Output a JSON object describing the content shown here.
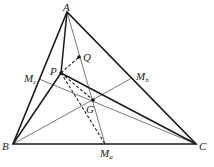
{
  "diagram": {
    "points": {
      "A": {
        "x": 67,
        "y": 12,
        "label": "A"
      },
      "B": {
        "x": 13,
        "y": 144,
        "label": "B"
      },
      "C": {
        "x": 196,
        "y": 144,
        "label": "C"
      },
      "Ma": {
        "x": 105,
        "y": 144,
        "label": "M",
        "sub": "a"
      },
      "Mb": {
        "x": 132,
        "y": 78,
        "label": "M",
        "sub": "b"
      },
      "Mc": {
        "x": 39,
        "y": 79,
        "label": "M",
        "sub": "c"
      },
      "P": {
        "x": 61,
        "y": 73,
        "label": "P"
      },
      "Q": {
        "x": 79,
        "y": 57,
        "label": "Q"
      },
      "G": {
        "x": 93,
        "y": 100,
        "label": "G"
      }
    },
    "colors": {
      "stroke": "#1a1a1a",
      "thin": "#555555",
      "background": "#ffffff"
    }
  }
}
